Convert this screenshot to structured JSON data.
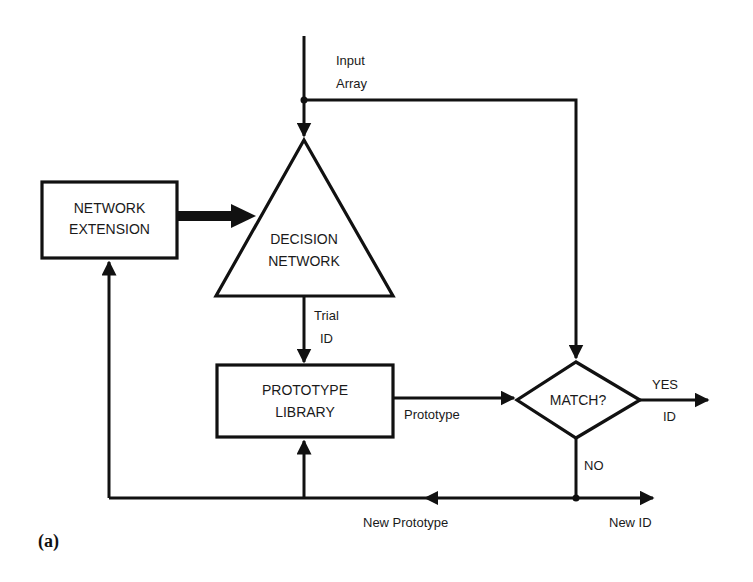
{
  "diagram": {
    "caption": "(a)",
    "nodes": {
      "network_extension": {
        "line1": "NETWORK",
        "line2": "EXTENSION",
        "shape": "rectangle"
      },
      "decision_network": {
        "line1": "DECISION",
        "line2": "NETWORK",
        "shape": "triangle"
      },
      "prototype_library": {
        "line1": "PROTOTYPE",
        "line2": "LIBRARY",
        "shape": "rectangle"
      },
      "match": {
        "label": "MATCH?",
        "shape": "diamond"
      }
    },
    "edges": {
      "input_array": {
        "line1": "Input",
        "line2": "Array"
      },
      "trial_id": {
        "line1": "Trial",
        "line2": "ID"
      },
      "prototype": {
        "label": "Prototype"
      },
      "yes": {
        "label": "YES"
      },
      "yes_id": {
        "label": "ID"
      },
      "no": {
        "label": "NO"
      },
      "new_prototype": {
        "label": "New Prototype"
      },
      "new_id": {
        "label": "New ID"
      }
    },
    "colors": {
      "ink": "#111111",
      "background": "#ffffff"
    }
  }
}
